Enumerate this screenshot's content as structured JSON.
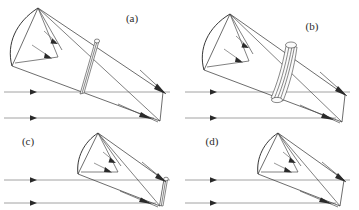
{
  "figure": {
    "type": "technical-line-diagram",
    "background_color": "#ffffff",
    "ink_color": "#2e2e2e",
    "ray_color": "#8c8c8c",
    "panel_count": 4,
    "layout": "2x2 grid"
  },
  "panels": [
    {
      "id": "a",
      "label": "(a)",
      "label_x": 132,
      "label_y": 22,
      "description": "large conical shell, thin single band",
      "band_style": "thin-single",
      "ray_lines": 2,
      "ray_y": [
        92,
        118
      ],
      "arrow_head_x": 33,
      "apex_x": 163,
      "apex_y": 92,
      "mouth_top_x": 38,
      "mouth_top_y": 8,
      "mouth_bottom_x": 12,
      "mouth_bottom_y": 66,
      "band_position": 0.52
    },
    {
      "id": "b",
      "label": "(b)",
      "label_x": 312,
      "label_y": 30,
      "description": "large conical shell, thick multi-line band",
      "band_style": "thick-multi",
      "ray_lines": 2,
      "ray_y": [
        92,
        118
      ],
      "arrow_head_x": 213,
      "apex_x": 343,
      "apex_y": 96,
      "mouth_top_x": 230,
      "mouth_top_y": 14,
      "mouth_bottom_x": 204,
      "mouth_bottom_y": 70,
      "band_position": 0.5
    },
    {
      "id": "c",
      "label": "(c)",
      "label_x": 28,
      "label_y": 145,
      "description": "small steep conical shell, thin band at apex",
      "band_style": "thin-apex",
      "ray_lines": 2,
      "ray_y": [
        180,
        203
      ],
      "arrow_head_x": 33,
      "apex_x": 163,
      "apex_y": 181,
      "mouth_top_x": 98,
      "mouth_top_y": 133,
      "mouth_bottom_x": 78,
      "mouth_bottom_y": 174,
      "band_position": 0.93
    },
    {
      "id": "d",
      "label": "(d)",
      "label_x": 212,
      "label_y": 145,
      "description": "small steep conical shell, no band",
      "band_style": "none",
      "ray_lines": 2,
      "ray_y": [
        180,
        203
      ],
      "arrow_head_x": 213,
      "apex_x": 343,
      "apex_y": 181,
      "mouth_top_x": 278,
      "mouth_top_y": 133,
      "mouth_bottom_x": 258,
      "mouth_bottom_y": 174,
      "band_position": null
    }
  ],
  "labels": {
    "a": "(a)",
    "b": "(b)",
    "c": "(c)",
    "d": "(d)"
  }
}
